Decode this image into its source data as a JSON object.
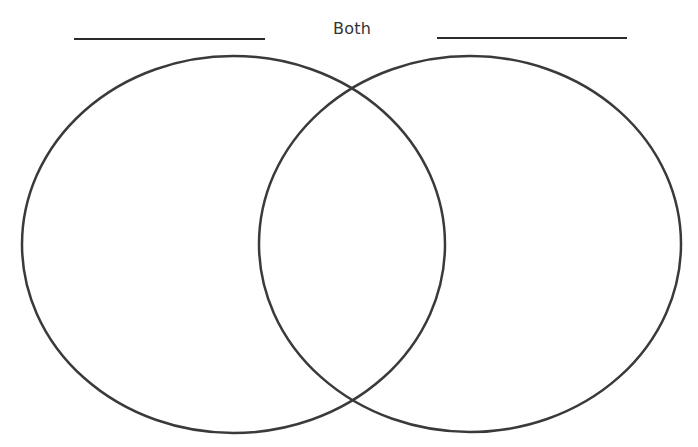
{
  "diagram": {
    "type": "venn",
    "sets": [
      {
        "id": "left",
        "title": "",
        "title_line": true,
        "items": []
      },
      {
        "id": "right",
        "title": "",
        "title_line": true,
        "items": []
      }
    ],
    "intersection": {
      "label": "Both",
      "items": []
    },
    "stroke_color": "#3a3a3a",
    "background_color": "#ffffff"
  }
}
